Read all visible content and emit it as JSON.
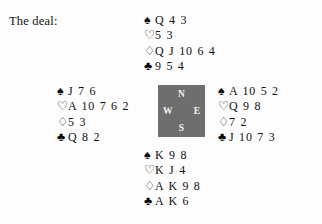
{
  "caption": {
    "text": "The deal:"
  },
  "suits": {
    "spade": {
      "name": "spade-pip",
      "glyph": "♠",
      "fill": "solid"
    },
    "heart": {
      "name": "heart-pip",
      "glyph": "♡",
      "fill": "hollow"
    },
    "diamond": {
      "name": "diamond-pip",
      "glyph": "♢",
      "fill": "hollow"
    },
    "club": {
      "name": "club-pip",
      "glyph": "♣",
      "fill": "solid"
    }
  },
  "compass": {
    "north": "N",
    "west": "W",
    "east": "E",
    "south": "S",
    "background": "#6e6e6e",
    "label_color": "#f2f2f2"
  },
  "hands": {
    "north": {
      "position": "North",
      "spades": "Q 4 3",
      "hearts": "5 3",
      "diamonds": "Q J 10 6 4",
      "clubs": "9 5 4"
    },
    "west": {
      "position": "West",
      "spades": "J 7 6",
      "hearts": "A 10 7 6 2",
      "diamonds": "5 3",
      "clubs": "Q 8 2"
    },
    "east": {
      "position": "East",
      "spades": "A 10 5 2",
      "hearts": "Q 9 8",
      "diamonds": "7 2",
      "clubs": "J 10 7 3"
    },
    "south": {
      "position": "South",
      "spades": "K 9 8",
      "hearts": "K J 4",
      "diamonds": "A K 9 8",
      "clubs": "A K 6"
    }
  }
}
